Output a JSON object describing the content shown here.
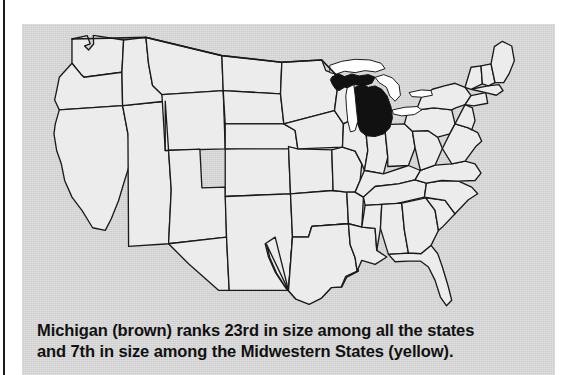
{
  "figure": {
    "kind": "us-state-locator-map",
    "panel_background": "#cdcdcd",
    "state_fill": "#ececec",
    "state_outline": "#1a1a1a",
    "highlight_fill": "#111111",
    "lakes_fill": "#ffffff",
    "gutter_rule_color": "#1a1a1a"
  },
  "map": {
    "title": "United States with Michigan highlighted",
    "highlighted_state": "Michigan",
    "highlight_color_named": "brown",
    "water_feature": "Great Lakes",
    "region_color_named": "yellow",
    "region": "Midwestern States"
  },
  "caption": {
    "line1": "Michigan (brown) ranks 23rd in size among all the states",
    "line2": "and 7th in size among the Midwestern States (yellow).",
    "state": "Michigan",
    "rank_all_states": "23rd",
    "rank_midwest": "7th"
  }
}
